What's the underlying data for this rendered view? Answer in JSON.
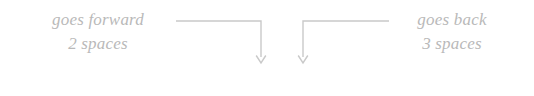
{
  "figure": {
    "background_color": "#ffffff",
    "line_color": "#c9c9c9",
    "annotation_color": "#b9b9b9",
    "expression_color": "#3a3a3a"
  },
  "annotations": {
    "left": {
      "line_1": "goes forward",
      "line_2": "2 spaces"
    },
    "right": {
      "line_1": "goes back",
      "line_2": "3 spaces"
    }
  },
  "expression": {
    "full": "2 − 3",
    "left_operand": "2",
    "operator": "−",
    "right_operand": "3"
  },
  "leaders": [
    {
      "name": "leader-left",
      "from_annotation": "left",
      "points_to": "left_operand",
      "horizontal_start_x": 176,
      "horizontal_end_x": 261,
      "horizontal_y": 21,
      "vertical_x": 261,
      "arrow_tip_y": 63
    },
    {
      "name": "leader-right",
      "from_annotation": "right",
      "points_to": "right_operand",
      "horizontal_start_x": 303,
      "horizontal_end_x": 389,
      "horizontal_y": 21,
      "vertical_x": 303,
      "arrow_tip_y": 63
    }
  ]
}
